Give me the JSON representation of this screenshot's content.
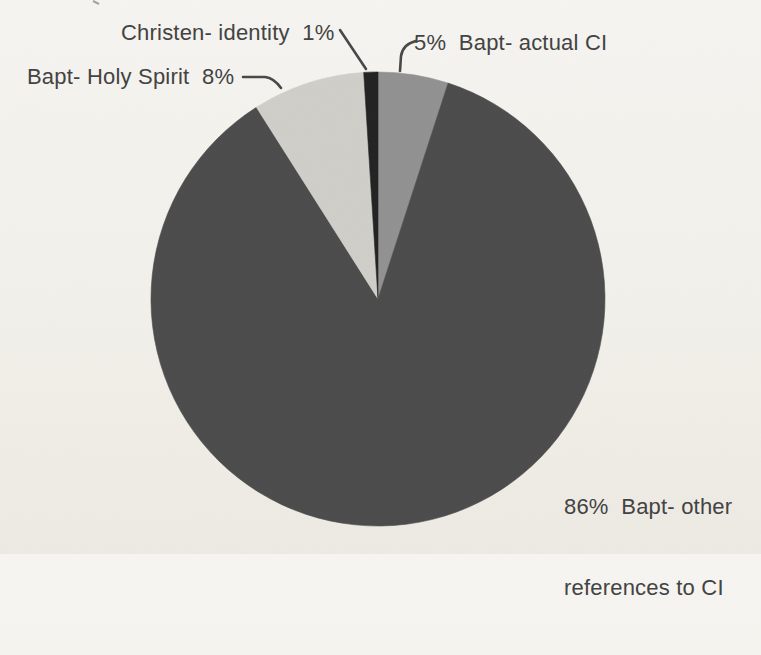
{
  "page": {
    "background": "#f2f0ea",
    "text_color": "#434343"
  },
  "chart_data": {
    "type": "pie",
    "title": "",
    "start": "top",
    "direction": "clockwise",
    "legend": "none",
    "units": "percent",
    "slices": [
      {
        "label": "Bapt- actual CI",
        "percent": 5,
        "color": "#919191"
      },
      {
        "label": "Bapt- other references to CI",
        "percent": 86,
        "color": "#4b4b4b"
      },
      {
        "label": "Bapt- Holy Spirit",
        "percent": 8,
        "color": "#cfcec9"
      },
      {
        "label": "Christen- identity",
        "percent": 1,
        "color": "#222222"
      }
    ]
  },
  "callouts": {
    "christen_identity": "Christen- identity  1%",
    "bapt_actual": "5%  Bapt- actual CI",
    "bapt_holy_spirit": "Bapt- Holy Spirit  8%",
    "bapt_other_line1": "86%  Bapt- other",
    "bapt_other_line2": "references to CI"
  }
}
